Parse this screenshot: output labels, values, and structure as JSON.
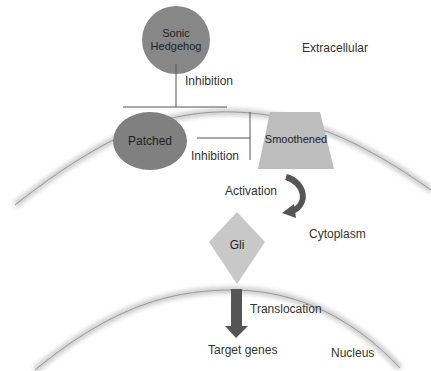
{
  "diagram": {
    "regions": {
      "extracellular": "Extracellular",
      "cytoplasm": "Cytoplasm",
      "nucleus": "Nucleus"
    },
    "nodes": {
      "shh": {
        "label_line1": "Sonic",
        "label_line2": "Hedgehog",
        "shape": "circle",
        "color": "#7a7a7a"
      },
      "patched": {
        "label": "Patched",
        "shape": "ellipse",
        "color": "#808080"
      },
      "smoothened": {
        "label": "Smoothened",
        "shape": "trapezoid",
        "color": "#bdbdbd"
      },
      "gli": {
        "label": "Gli",
        "shape": "diamond",
        "color": "#c8c8c8"
      },
      "target": {
        "label": "Target genes"
      }
    },
    "edges": {
      "shh_patched": {
        "label": "Inhibition",
        "type": "inhibition"
      },
      "patched_smo": {
        "label": "Inhibition",
        "type": "inhibition"
      },
      "smo_gli": {
        "label": "Activation",
        "type": "activation"
      },
      "gli_target": {
        "label": "Translocation",
        "type": "arrow"
      }
    },
    "colors": {
      "membrane": "#c9c9c9",
      "arrow": "#555555"
    }
  }
}
